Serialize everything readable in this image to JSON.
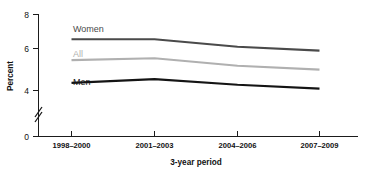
{
  "chart_data": {
    "type": "line",
    "title": "",
    "xlabel": "3-year period",
    "ylabel": "Percent",
    "categories": [
      "1998–2000",
      "2001–2003",
      "2004–2006",
      "2007–2009"
    ],
    "series": [
      {
        "name": "Women",
        "values": [
          6.7,
          6.7,
          6.3,
          6.1
        ],
        "color": "#4a4a4a"
      },
      {
        "name": "All",
        "values": [
          5.6,
          5.7,
          5.3,
          5.1
        ],
        "color": "#b0b0b0"
      },
      {
        "name": "Men",
        "values": [
          4.4,
          4.6,
          4.3,
          4.1
        ],
        "color": "#141414"
      }
    ],
    "ylim": [
      0,
      8
    ],
    "yticks": [
      0,
      4,
      6,
      8
    ],
    "ytick_labels": [
      "0",
      "4",
      "6",
      "8"
    ],
    "axis_break": true,
    "axis_break_between": [
      0,
      4
    ],
    "grid": false,
    "legend": "inline-labels"
  },
  "axes": {
    "y_title": "Percent",
    "x_title": "3-year period",
    "y_labels": {
      "t8": "8",
      "t6": "6",
      "t4": "4",
      "t0": "0"
    },
    "x_labels": {
      "p1": "1998–2000",
      "p2": "2001–2003",
      "p3": "2004–2006",
      "p4": "2007–2009"
    }
  },
  "series_labels": {
    "women": "Women",
    "all": "All",
    "men": "Men"
  },
  "colors": {
    "women": "#4a4a4a",
    "all": "#b0b0b0",
    "men": "#141414",
    "axis": "#1b1b1b",
    "background": "#ffffff"
  }
}
